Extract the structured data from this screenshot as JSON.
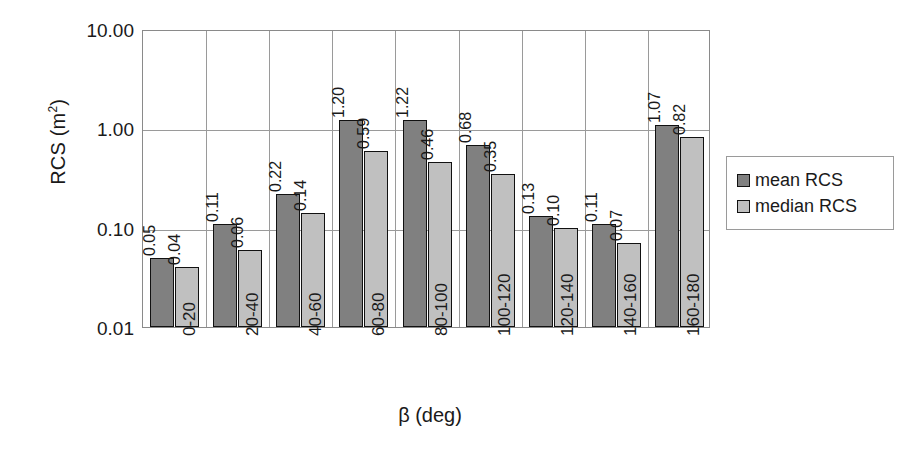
{
  "chart_data": {
    "type": "bar",
    "title": "",
    "xlabel": "β (deg)",
    "ylabel": "RCS (m²)",
    "ylabel_base": "RCS (m",
    "ylabel_sup": "2",
    "ylabel_tail": ")",
    "yscale": "log",
    "ylim": [
      0.01,
      10.0
    ],
    "ytick_labels": [
      "10.00",
      "1.00",
      "0.10",
      "0.01"
    ],
    "ytick_values": [
      10.0,
      1.0,
      0.1,
      0.01
    ],
    "grid": "horizontal-and-vertical",
    "legend_position": "right",
    "categories": [
      "0-20",
      "20-40",
      "40-60",
      "60-80",
      "80-100",
      "100-120",
      "120-140",
      "140-160",
      "160-180"
    ],
    "series": [
      {
        "name": "mean RCS",
        "color": "#808080",
        "values": [
          0.05,
          0.11,
          0.22,
          1.2,
          1.22,
          0.68,
          0.13,
          0.11,
          1.07
        ],
        "labels": [
          "0.05",
          "0.11",
          "0.22",
          "1.20",
          "1.22",
          "0.68",
          "0.13",
          "0.11",
          "1.07"
        ]
      },
      {
        "name": "median RCS",
        "color": "#c0c0c0",
        "values": [
          0.04,
          0.06,
          0.14,
          0.59,
          0.46,
          0.35,
          0.1,
          0.07,
          0.82
        ],
        "labels": [
          "0.04",
          "0.06",
          "0.14",
          "0.59",
          "0.46",
          "0.35",
          "0.10",
          "0.07",
          "0.82"
        ]
      }
    ]
  },
  "legend": {
    "items": [
      {
        "label": "mean RCS",
        "swatch": "mean"
      },
      {
        "label": "median RCS",
        "swatch": "median"
      }
    ]
  },
  "colors": {
    "mean": "#808080",
    "median": "#c0c0c0",
    "grid": "#9a9a9a",
    "axis": "#8a8a8a",
    "text": "#1a1a1a"
  }
}
